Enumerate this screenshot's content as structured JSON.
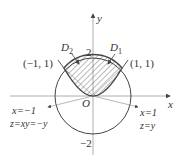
{
  "diagram": {
    "axes": {
      "x_label": "x",
      "y_label": "y",
      "origin_label": "O"
    },
    "ticks": {
      "top": "2",
      "bottom": "−2"
    },
    "regions": [
      {
        "id": "D1",
        "label": "D",
        "sub": "1"
      },
      {
        "id": "D2",
        "label": "D",
        "sub": "2"
      }
    ],
    "points": [
      {
        "label": "(−1, 1)"
      },
      {
        "label": "(1, 1)"
      }
    ],
    "annotations": {
      "left_line": "x=−1",
      "left_eq": "z=xy=−y",
      "right_line": "x=1",
      "right_eq": "z=y"
    },
    "colors": {
      "stroke": "#444444",
      "hatch": "#555555",
      "thin": "#888888"
    }
  }
}
